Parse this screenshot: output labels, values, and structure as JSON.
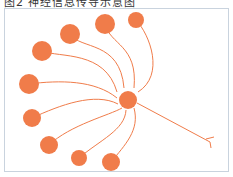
{
  "figure": {
    "title": "图2 神经信息传导示意图",
    "neuron_color": "#f07c4a",
    "frame_color": "#c9d3de"
  },
  "diagram": {
    "central_neuron": {
      "x": 128,
      "y": 100,
      "r": 9
    },
    "input_neurons": [
      {
        "x": 136,
        "y": 20,
        "r": 8
      },
      {
        "x": 105,
        "y": 24,
        "r": 10
      },
      {
        "x": 70,
        "y": 34,
        "r": 10
      },
      {
        "x": 42,
        "y": 51,
        "r": 10
      },
      {
        "x": 29,
        "y": 84,
        "r": 10
      },
      {
        "x": 32,
        "y": 118,
        "r": 9
      },
      {
        "x": 49,
        "y": 145,
        "r": 9
      },
      {
        "x": 79,
        "y": 158,
        "r": 8
      },
      {
        "x": 111,
        "y": 162,
        "r": 9
      }
    ],
    "axon_terminal": {
      "x": 212,
      "y": 143
    }
  }
}
